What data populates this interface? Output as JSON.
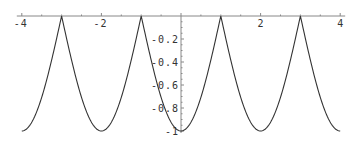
{
  "chart_data": {
    "type": "line",
    "title": "",
    "xlabel": "",
    "ylabel": "",
    "function": "y = -|cos(pi*x/2)|",
    "xlim": [
      -4,
      4
    ],
    "ylim": [
      -1,
      0
    ],
    "grid": false,
    "legend": null,
    "x_ticks": [
      -4,
      -2,
      2,
      4
    ],
    "x_tick_labels": [
      "-4",
      "-2",
      "2",
      "4"
    ],
    "y_ticks": [
      -0.2,
      -0.4,
      -0.6,
      -0.8,
      -1
    ],
    "y_tick_labels": [
      "-0.2",
      "-0.4",
      "-0.6",
      "-0.8",
      "-1"
    ],
    "series": [
      {
        "name": "y",
        "x": [
          -4,
          -3.5,
          -3,
          -2.5,
          -2,
          -1.5,
          -1,
          -0.5,
          0,
          0.5,
          1,
          1.5,
          2,
          2.5,
          3,
          3.5,
          4
        ],
        "y": [
          -1,
          -0.707,
          0,
          -0.707,
          -1,
          -0.707,
          0,
          -0.707,
          -1,
          -0.707,
          0,
          -0.707,
          -1,
          -0.707,
          0,
          -0.707,
          -1
        ]
      }
    ],
    "colors": {
      "curve": "#333333",
      "axis": "#888888"
    }
  },
  "layout": {
    "origin_px": [
      181,
      16
    ],
    "px_per_x": 39.8,
    "px_per_y": 115
  }
}
